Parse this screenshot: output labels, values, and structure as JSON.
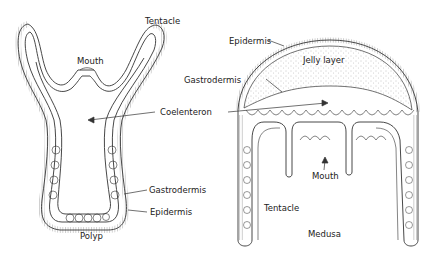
{
  "figure": {
    "polyp": {
      "title": "Polyp",
      "labels": {
        "tentacle": "Tentacle",
        "mouth": "Mouth",
        "gastrodermis": "Gastrodermis",
        "epidermis": "Epidermis"
      }
    },
    "medusa": {
      "title": "Medusa",
      "labels": {
        "epidermis": "Epidermis",
        "jelly_layer": "Jelly layer",
        "gastrodermis": "Gastrodermis",
        "mouth": "Mouth",
        "tentacle": "Tentacle"
      }
    },
    "shared": {
      "coelenteron": "Coelenteron"
    },
    "colors": {
      "line": "#333333",
      "stipple": "#888888",
      "background": "#ffffff"
    }
  }
}
